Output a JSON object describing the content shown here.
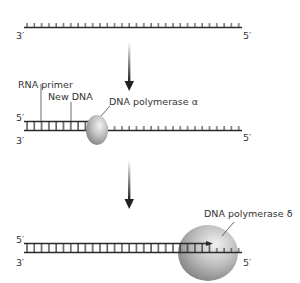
{
  "diagram": {
    "title": "",
    "stage1": {
      "left_end": "3′",
      "right_end": "5′"
    },
    "stage2": {
      "rna_primer_label": "RNA primer",
      "new_dna_label": "New DNA",
      "enzyme_label": "DNA polymerase α",
      "top_left_end": "5′",
      "bottom_left_end": "3′",
      "bottom_right_end": "5′"
    },
    "stage3": {
      "enzyme_label": "DNA polymerase δ",
      "top_left_end": "5′",
      "bottom_left_end": "3′",
      "bottom_right_end": "5′"
    },
    "colors": {
      "strand": "#2a2a2a",
      "enzyme_light": "#e6e6e6",
      "enzyme_dark": "#8a8a8a",
      "text": "#333333"
    }
  }
}
